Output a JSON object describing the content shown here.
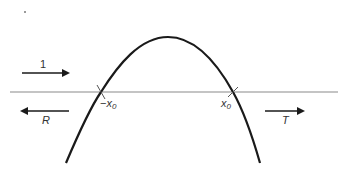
{
  "diagram": {
    "axis": {
      "name": "x-axis",
      "color": "#8a8a8a"
    },
    "curve": {
      "name": "barrier",
      "color": "#1a1a1a",
      "shape": "inverted-parabola"
    },
    "arrows": {
      "incident": {
        "label": "1",
        "direction": "right"
      },
      "reflected": {
        "label": "R",
        "direction": "left"
      },
      "transmitted": {
        "label": "T",
        "direction": "right"
      }
    },
    "turning_points": {
      "left": {
        "sign": "−",
        "var": "x",
        "sub": "0"
      },
      "right": {
        "sign": "",
        "var": "x",
        "sub": "0"
      }
    },
    "colors": {
      "ink": "#1a1a1a",
      "axis": "#8a8a8a",
      "background": "#ffffff"
    }
  }
}
